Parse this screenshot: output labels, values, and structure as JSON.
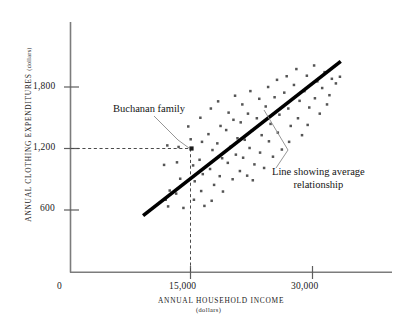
{
  "chart_data": {
    "type": "scatter",
    "title": "",
    "xlabel": "ANNUAL HOUSEHOLD INCOME",
    "xlabel_sub": "(dollars)",
    "ylabel": "ANNUAL CLOTHING EXPENDITURES",
    "ylabel_sub": "(dollars)",
    "xticks": [
      0,
      15000,
      30000
    ],
    "xtick_labels": [
      "0",
      "15,000",
      "30,000"
    ],
    "ytick_labels": [
      "600",
      "1,200",
      "1,800"
    ],
    "yticks": [
      600,
      1200,
      1800
    ],
    "xlim": [
      0,
      37000
    ],
    "ylim": [
      0,
      2300
    ],
    "grid": false,
    "legend": "none",
    "marker_color": "#555555",
    "line_color": "#000000",
    "highlight_point": {
      "x": 15000,
      "y": 1200,
      "label": "Buchanan family"
    },
    "trend_line": {
      "x1": 9000,
      "y1": 545,
      "x2": 33500,
      "y2": 2050,
      "label": "Line showing average relationship"
    },
    "points": [
      [
        12000,
        1230
      ],
      [
        11600,
        1040
      ],
      [
        12300,
        790
      ],
      [
        11800,
        700
      ],
      [
        12100,
        635
      ],
      [
        13400,
        1215
      ],
      [
        13200,
        1065
      ],
      [
        13600,
        905
      ],
      [
        13100,
        760
      ],
      [
        14000,
        620
      ],
      [
        14600,
        1415
      ],
      [
        14900,
        1290
      ],
      [
        15000,
        1200
      ],
      [
        15200,
        1035
      ],
      [
        15400,
        880
      ],
      [
        15300,
        700
      ],
      [
        16100,
        1500
      ],
      [
        16300,
        1265
      ],
      [
        16000,
        1090
      ],
      [
        16400,
        950
      ],
      [
        16200,
        785
      ],
      [
        16600,
        640
      ],
      [
        17400,
        1590
      ],
      [
        17100,
        1340
      ],
      [
        17600,
        1185
      ],
      [
        17300,
        1000
      ],
      [
        17800,
        845
      ],
      [
        17500,
        690
      ],
      [
        18300,
        1660
      ],
      [
        18600,
        1420
      ],
      [
        18200,
        1250
      ],
      [
        18800,
        1105
      ],
      [
        18500,
        930
      ],
      [
        18900,
        780
      ],
      [
        19600,
        1550
      ],
      [
        19300,
        1380
      ],
      [
        19800,
        1215
      ],
      [
        19500,
        1060
      ],
      [
        20100,
        900
      ],
      [
        20400,
        1715
      ],
      [
        20200,
        1480
      ],
      [
        20700,
        1300
      ],
      [
        20500,
        1140
      ],
      [
        21000,
        980
      ],
      [
        21300,
        1630
      ],
      [
        21100,
        1455
      ],
      [
        21600,
        1285
      ],
      [
        21400,
        1110
      ],
      [
        21900,
        935
      ],
      [
        22300,
        1760
      ],
      [
        22000,
        1540
      ],
      [
        22500,
        1375
      ],
      [
        22200,
        1205
      ],
      [
        22800,
        1045
      ],
      [
        22600,
        890
      ],
      [
        23400,
        1685
      ],
      [
        23100,
        1495
      ],
      [
        23700,
        1330
      ],
      [
        23500,
        1160
      ],
      [
        24000,
        1010
      ],
      [
        24500,
        1800
      ],
      [
        24200,
        1610
      ],
      [
        24800,
        1440
      ],
      [
        24600,
        1270
      ],
      [
        25100,
        1120
      ],
      [
        25600,
        1870
      ],
      [
        25300,
        1700
      ],
      [
        25900,
        1530
      ],
      [
        25700,
        1355
      ],
      [
        26200,
        1190
      ],
      [
        26800,
        1905
      ],
      [
        26500,
        1745
      ],
      [
        27000,
        1590
      ],
      [
        27300,
        1420
      ],
      [
        27100,
        1265
      ],
      [
        28000,
        1975
      ],
      [
        27700,
        1820
      ],
      [
        28400,
        1665
      ],
      [
        28200,
        1495
      ],
      [
        28700,
        1330
      ],
      [
        29300,
        1910
      ],
      [
        29000,
        1760
      ],
      [
        29600,
        1600
      ],
      [
        29400,
        1430
      ],
      [
        30200,
        2010
      ],
      [
        30600,
        1855
      ],
      [
        30300,
        1690
      ],
      [
        30900,
        1540
      ],
      [
        31500,
        1945
      ],
      [
        31200,
        1790
      ],
      [
        31800,
        1630
      ],
      [
        32400,
        1880
      ],
      [
        32100,
        1720
      ],
      [
        32900,
        1835
      ],
      [
        33400,
        1900
      ]
    ]
  }
}
